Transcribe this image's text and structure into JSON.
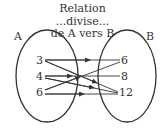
{
  "title": {
    "line1": "Relation",
    "line2": "...divise...",
    "line3": "de A vers B"
  },
  "sets": {
    "A": {
      "label": "A",
      "elements": [
        "3",
        "4",
        "6"
      ]
    },
    "B": {
      "label": "B",
      "elements": [
        "6",
        "8",
        "12"
      ]
    }
  },
  "relation": {
    "name": "divise",
    "pairs": [
      {
        "from": "3",
        "to": "6"
      },
      {
        "from": "3",
        "to": "12"
      },
      {
        "from": "4",
        "to": "8"
      },
      {
        "from": "4",
        "to": "12"
      },
      {
        "from": "6",
        "to": "6"
      },
      {
        "from": "6",
        "to": "12"
      }
    ]
  },
  "colors": {
    "stroke": "#333333",
    "background": "#ffffff"
  }
}
